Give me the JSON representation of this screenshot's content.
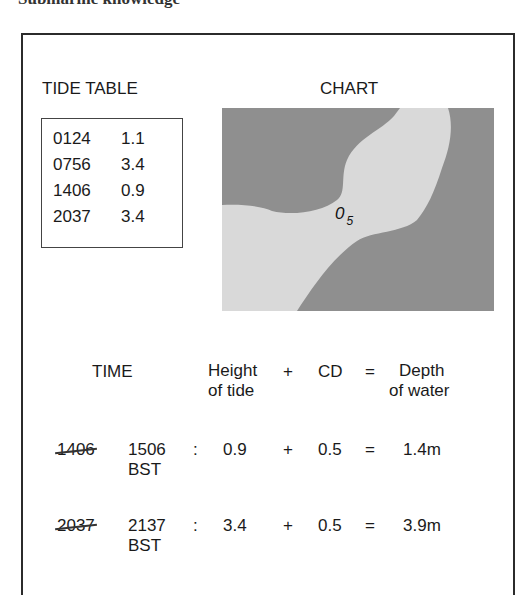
{
  "heading_cut": "Submarine knowledge",
  "tide_table": {
    "title": "TIDE TABLE",
    "rows": [
      {
        "time": "0124",
        "height": "1.1"
      },
      {
        "time": "0756",
        "height": "3.4"
      },
      {
        "time": "1406",
        "height": "0.9"
      },
      {
        "time": "2037",
        "height": "3.4"
      }
    ]
  },
  "chart": {
    "title": "CHART",
    "sounding_main": "0",
    "sounding_sub": "5",
    "colors": {
      "land": "#8f8f8f",
      "water": "#d9d9d9"
    }
  },
  "equation": {
    "headers": {
      "time": "TIME",
      "height_line1": "Height",
      "height_line2": "of tide",
      "plus": "+",
      "cd": "CD",
      "equals": "=",
      "depth_line1": "Depth",
      "depth_line2": "of water"
    },
    "rows": [
      {
        "struck_time": "1406",
        "bst_time": "1506",
        "bst_label": "BST",
        "colon": ":",
        "height": "0.9",
        "plus": "+",
        "cd": "0.5",
        "equals": "=",
        "depth": "1.4m"
      },
      {
        "struck_time": "2037",
        "bst_time": "2137",
        "bst_label": "BST",
        "colon": ":",
        "height": "3.4",
        "plus": "+",
        "cd": "0.5",
        "equals": "=",
        "depth": "3.9m"
      }
    ]
  }
}
